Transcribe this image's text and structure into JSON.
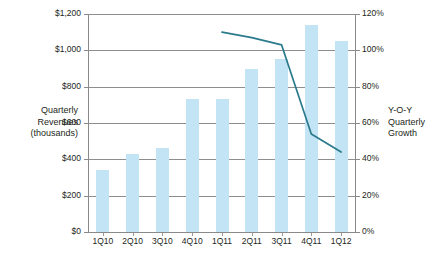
{
  "chart_data": {
    "type": "bar",
    "title": "",
    "categories": [
      "1Q10",
      "2Q10",
      "3Q10",
      "4Q10",
      "1Q11",
      "2Q11",
      "3Q11",
      "4Q11",
      "1Q12"
    ],
    "series": [
      {
        "name": "Quarterly Revenues (thousands)",
        "type": "bar",
        "axis": "left",
        "color": "#c3e4f4",
        "values": [
          340,
          430,
          465,
          730,
          730,
          895,
          950,
          1140,
          1050
        ]
      },
      {
        "name": "Y-O-Y Quarterly Growth",
        "type": "line",
        "axis": "right",
        "color": "#2a7a8c",
        "values": [
          null,
          null,
          null,
          null,
          110,
          107,
          103,
          54,
          44
        ]
      }
    ],
    "xlabel": "",
    "ylabel": "Quarterly Revenues (thousands)",
    "y2label": "Y-O-Y Quarterly Growth",
    "ylim": [
      0,
      1200
    ],
    "y2lim": [
      0,
      120
    ],
    "yticks": [
      "$0",
      "$200",
      "$400",
      "$600",
      "$800",
      "$1,000",
      "$1,200"
    ],
    "ytick_values": [
      0,
      200,
      400,
      600,
      800,
      1000,
      1200
    ],
    "y2ticks": [
      "0%",
      "20%",
      "40%",
      "60%",
      "80%",
      "100%",
      "120%"
    ],
    "y2tick_values": [
      0,
      20,
      40,
      60,
      80,
      100,
      120
    ],
    "grid": true,
    "legend": "none"
  },
  "axis_titles": {
    "left": [
      "Quarterly",
      "Revenues",
      "(thousands)"
    ],
    "right": [
      "Y-O-Y",
      "Quarterly",
      "Growth"
    ]
  }
}
